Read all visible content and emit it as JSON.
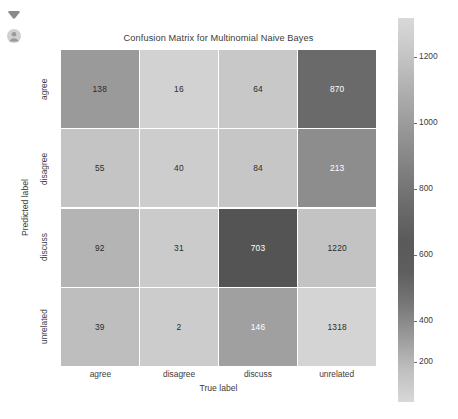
{
  "corner_icons": [
    {
      "name": "chevron-down-icon",
      "glyph": "chevron-down"
    },
    {
      "name": "account-avatar-icon",
      "glyph": "person-circle"
    }
  ],
  "chart_data": {
    "type": "heatmap",
    "title": "Confusion Matrix for Multinomial Naive Bayes",
    "xlabel": "True label",
    "ylabel": "Predicted label",
    "categories_x": [
      "agree",
      "disagree",
      "discuss",
      "unrelated"
    ],
    "categories_y": [
      "agree",
      "disagree",
      "discuss",
      "unrelated"
    ],
    "matrix": [
      [
        138,
        16,
        64,
        870
      ],
      [
        55,
        40,
        84,
        213
      ],
      [
        92,
        31,
        703,
        1220
      ],
      [
        39,
        2,
        146,
        1318
      ]
    ],
    "cell_colors": [
      [
        "#9a9a9a",
        "#d2d2d2",
        "#c8c8c8",
        "#6a6a6a"
      ],
      [
        "#c4c4c4",
        "#cdcdcd",
        "#c6c6c6",
        "#8d8d8d"
      ],
      [
        "#b4b4b4",
        "#cbcbcb",
        "#545454",
        "#c3c3c3"
      ],
      [
        "#bebebe",
        "#cccccc",
        "#a0a0a0",
        "#d4d4d4"
      ]
    ],
    "cell_text_colors": [
      [
        "#2b2b2b",
        "#2b2b2b",
        "#2b2b2b",
        "#ffffff"
      ],
      [
        "#2b2b2b",
        "#2b2b2b",
        "#2b2b2b",
        "#ffffff"
      ],
      [
        "#2b2b2b",
        "#2b2b2b",
        "#ffffff",
        "#2b2b2b"
      ],
      [
        "#2b2b2b",
        "#2b2b2b",
        "#ffffff",
        "#2b2b2b"
      ]
    ],
    "colorbar": {
      "ticks": [
        1200,
        1000,
        800,
        600,
        400,
        200
      ],
      "tick_positions_pct": [
        10.2,
        27.3,
        44.5,
        61.7,
        78.9,
        89.5
      ],
      "orientation": "vertical",
      "position": "right"
    },
    "grid": false,
    "legend_position": "none"
  }
}
